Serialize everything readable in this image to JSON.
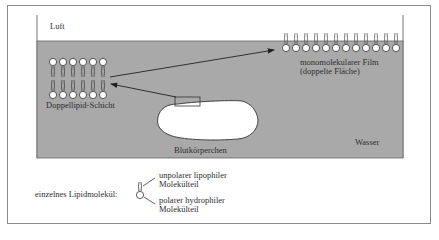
{
  "diagram": {
    "air_label": "Luft",
    "water_label": "Wasser",
    "bilayer_label": "Doppellipid-Schicht",
    "monolayer_label_line1": "monomolekularer Film",
    "monolayer_label_line2": "(doppelte Fläche)",
    "blood_cell_label": "Blutkörperchen",
    "legend": {
      "molecule_label": "einzelnes Lipidmolekül:",
      "tail_label_line1": "unpolarer lipophiler",
      "tail_label_line2": "Molekülteil",
      "head_label_line1": "polarer hydrophiler",
      "head_label_line2": "Molekülteil"
    },
    "colors": {
      "water": "#a9a9a9",
      "air": "#ffffff",
      "lipid_head": "#ffffff",
      "outline": "#2a2a2a"
    },
    "bilayer_columns": 6,
    "monolayer_molecules": 12
  }
}
